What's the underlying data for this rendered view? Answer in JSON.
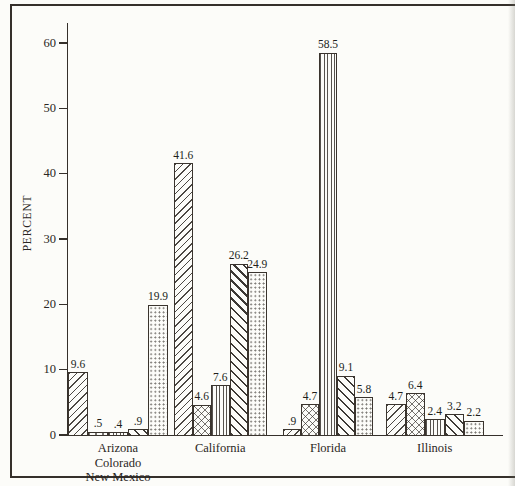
{
  "page": {
    "background": "#fcfcf9",
    "ink": "#35302b",
    "kind": "scanned statistical chart, no title, no legend"
  },
  "chart_data": {
    "type": "bar",
    "title": "",
    "xlabel": "",
    "ylabel": "PERCENT",
    "ylim": [
      0,
      62
    ],
    "yticks": [
      0,
      10,
      20,
      30,
      40,
      50,
      60
    ],
    "grid": false,
    "legend": "none",
    "categories": [
      "Arizona Colorado New Mexico",
      "California",
      "Florida",
      "Illinois"
    ],
    "category_label_lines": [
      [
        "Arizona",
        "Colorado",
        "New Mexico"
      ],
      [
        "California"
      ],
      [
        "Florida"
      ],
      [
        "Illinois"
      ]
    ],
    "series": [
      {
        "name": "series-1",
        "pattern": "diagonal-up-hatch",
        "values": [
          9.6,
          41.6,
          0.9,
          4.7
        ],
        "labels": [
          "9.6",
          "41.6",
          ".9",
          "4.7"
        ]
      },
      {
        "name": "series-2",
        "pattern": "crosshatch",
        "values": [
          0.5,
          4.6,
          4.7,
          6.4
        ],
        "labels": [
          ".5",
          "4.6",
          "4.7",
          "6.4"
        ]
      },
      {
        "name": "series-3",
        "pattern": "vertical-lines",
        "values": [
          0.4,
          7.6,
          58.5,
          2.4
        ],
        "labels": [
          ".4",
          "7.6",
          "58.5",
          "2.4"
        ]
      },
      {
        "name": "series-4",
        "pattern": "diagonal-down-hatch",
        "values": [
          0.9,
          26.2,
          9.1,
          3.2
        ],
        "labels": [
          ".9",
          "26.2",
          "9.1",
          "3.2"
        ]
      },
      {
        "name": "series-5",
        "pattern": "dots",
        "values": [
          19.9,
          24.9,
          5.8,
          2.2
        ],
        "labels": [
          "19.9",
          "24.9",
          "5.8",
          "2.2"
        ]
      }
    ]
  }
}
